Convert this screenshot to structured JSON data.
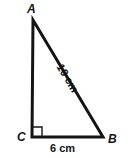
{
  "figure": {
    "kind": "right-triangle-diagram",
    "background_color": "#ffffff",
    "stroke_color": "#141414",
    "stroke_width": 3,
    "right_angle_at": "C"
  },
  "vertices": {
    "a": {
      "label": "A",
      "x": 33,
      "y": 20
    },
    "c": {
      "label": "C",
      "x": 32,
      "y": 137
    },
    "b": {
      "label": "B",
      "x": 103,
      "y": 137
    }
  },
  "sides": {
    "hypotenuse": {
      "name": "AB",
      "measure_label": "10 cm",
      "value": 10,
      "unit": "cm",
      "rotation_deg": 59
    },
    "base": {
      "name": "CB",
      "measure_label": "6 cm",
      "value": 6,
      "unit": "cm",
      "rotation_deg": 0
    },
    "vertical_leg": {
      "name": "AC",
      "measure_label": "",
      "value": null,
      "unit": "cm"
    }
  },
  "right_angle_marker": {
    "name": "right-angle-square",
    "at_vertex": "C",
    "size": 10
  }
}
